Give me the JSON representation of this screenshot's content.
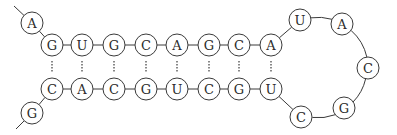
{
  "diagram": {
    "style": {
      "stroke_color": "#3a3a3a",
      "text_color": "#2a2a2a",
      "background": "#ffffff",
      "radius": 11
    },
    "tails": {
      "top": {
        "from": [
          14,
          6
        ],
        "to": [
          32,
          23
        ]
      },
      "bottom": {
        "from": [
          32,
          113
        ],
        "to": [
          16,
          129
        ]
      }
    },
    "nodes": [
      {
        "id": "n1",
        "base": "A",
        "x": 32,
        "y": 23,
        "role": "5-prime-overhang"
      },
      {
        "id": "n2",
        "base": "G",
        "x": 52,
        "y": 45,
        "role": "stem-top"
      },
      {
        "id": "n3",
        "base": "U",
        "x": 82,
        "y": 45,
        "role": "stem-top"
      },
      {
        "id": "n4",
        "base": "G",
        "x": 114,
        "y": 45,
        "role": "stem-top"
      },
      {
        "id": "n5",
        "base": "C",
        "x": 146,
        "y": 45,
        "role": "stem-top"
      },
      {
        "id": "n6",
        "base": "A",
        "x": 177,
        "y": 45,
        "role": "stem-top"
      },
      {
        "id": "n7",
        "base": "G",
        "x": 209,
        "y": 45,
        "role": "stem-top"
      },
      {
        "id": "n8",
        "base": "C",
        "x": 239,
        "y": 45,
        "role": "stem-top"
      },
      {
        "id": "n9",
        "base": "A",
        "x": 271,
        "y": 45,
        "role": "stem-top"
      },
      {
        "id": "n10",
        "base": "U",
        "x": 300,
        "y": 20,
        "role": "loop"
      },
      {
        "id": "n11",
        "base": "A",
        "x": 342,
        "y": 24,
        "role": "loop"
      },
      {
        "id": "n12",
        "base": "C",
        "x": 368,
        "y": 68,
        "role": "loop"
      },
      {
        "id": "n13",
        "base": "G",
        "x": 344,
        "y": 108,
        "role": "loop"
      },
      {
        "id": "n14",
        "base": "C",
        "x": 301,
        "y": 117,
        "role": "loop"
      },
      {
        "id": "n15",
        "base": "U",
        "x": 271,
        "y": 89,
        "role": "stem-bottom"
      },
      {
        "id": "n16",
        "base": "G",
        "x": 239,
        "y": 89,
        "role": "stem-bottom"
      },
      {
        "id": "n17",
        "base": "C",
        "x": 209,
        "y": 89,
        "role": "stem-bottom"
      },
      {
        "id": "n18",
        "base": "U",
        "x": 177,
        "y": 89,
        "role": "stem-bottom"
      },
      {
        "id": "n19",
        "base": "G",
        "x": 146,
        "y": 89,
        "role": "stem-bottom"
      },
      {
        "id": "n20",
        "base": "C",
        "x": 114,
        "y": 89,
        "role": "stem-bottom"
      },
      {
        "id": "n21",
        "base": "A",
        "x": 82,
        "y": 89,
        "role": "stem-bottom"
      },
      {
        "id": "n22",
        "base": "C",
        "x": 52,
        "y": 89,
        "role": "stem-bottom"
      },
      {
        "id": "n23",
        "base": "G",
        "x": 32,
        "y": 113,
        "role": "3-prime-overhang"
      }
    ],
    "pairs": [
      [
        "n2",
        "n22"
      ],
      [
        "n3",
        "n21"
      ],
      [
        "n4",
        "n20"
      ],
      [
        "n5",
        "n19"
      ],
      [
        "n6",
        "n18"
      ],
      [
        "n7",
        "n17"
      ],
      [
        "n8",
        "n16"
      ],
      [
        "n9",
        "n15"
      ]
    ],
    "top_strand": "AGUGCAGCA",
    "loop": "UACGC",
    "bottom_strand": "UGCUGCACG"
  }
}
